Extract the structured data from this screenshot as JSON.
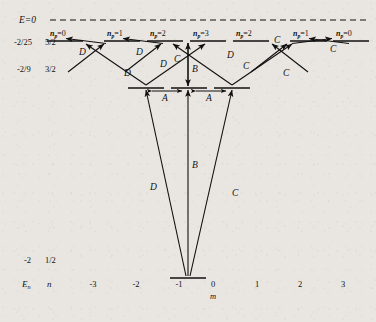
{
  "figure": {
    "type": "energy-level-diagram",
    "background_color": "#e9e6e1",
    "line_color": "#111111",
    "width": 376,
    "height": 322
  },
  "axes": {
    "zero_line_label": "E=0",
    "zero_line_style": "dashed",
    "x_axis_label": "m",
    "x_ticks": [
      "-3",
      "-2",
      "-1",
      "0",
      "1",
      "2",
      "3"
    ],
    "row_headers": [
      "E",
      "n"
    ],
    "row_header_sub": "n"
  },
  "levels": [
    {
      "name": "n-5-2",
      "energy": "-2/25",
      "n": "5/2",
      "m_values": [
        -3,
        -2,
        -1,
        0,
        1,
        2,
        3
      ],
      "np_labels": [
        "n=0",
        "n=1",
        "n=2",
        "n=3",
        "n=2",
        "n=1",
        "n=0"
      ],
      "np_sub": "p",
      "np_values": [
        "0",
        "1",
        "2",
        "3",
        "2",
        "1",
        "0"
      ]
    },
    {
      "name": "n-3-2",
      "energy": "-2/9",
      "n": "3/2",
      "m_values": [
        -1,
        0,
        1
      ],
      "np_values": []
    },
    {
      "name": "n-1-2",
      "energy": "-2",
      "n": "1/2",
      "m_values": [
        0
      ],
      "np_values": []
    }
  ],
  "transition_labels": {
    "A": "A",
    "B": "B",
    "C": "C",
    "D": "D"
  },
  "annotations": [
    {
      "id": "D1",
      "label": "D",
      "x": 79,
      "y": 51
    },
    {
      "id": "D2",
      "label": "D",
      "x": 133,
      "y": 51
    },
    {
      "id": "D3",
      "label": "D",
      "x": 159,
      "y": 63
    },
    {
      "id": "D4",
      "label": "D",
      "x": 126,
      "y": 73
    },
    {
      "id": "C1",
      "label": "C",
      "x": 187,
      "y": 61
    },
    {
      "id": "D5",
      "label": "D",
      "x": 226,
      "y": 54
    },
    {
      "id": "C2",
      "label": "C",
      "x": 245,
      "y": 65
    },
    {
      "id": "C3",
      "label": "C",
      "x": 286,
      "y": 72
    },
    {
      "id": "C4",
      "label": "C",
      "x": 277,
      "y": 41
    },
    {
      "id": "C5",
      "label": "C",
      "x": 333,
      "y": 49
    },
    {
      "id": "B1",
      "label": "B",
      "x": 196,
      "y": 70
    },
    {
      "id": "A1",
      "label": "A",
      "x": 160,
      "y": 96
    },
    {
      "id": "A2",
      "label": "A",
      "x": 214,
      "y": 96
    },
    {
      "id": "B2",
      "label": "B",
      "x": 196,
      "y": 165
    },
    {
      "id": "D6",
      "label": "D",
      "x": 152,
      "y": 185
    },
    {
      "id": "C6",
      "label": "C",
      "x": 235,
      "y": 190
    }
  ],
  "geometry": {
    "note": "m=0 at x=188, spacing 43px; rows y: dashed=20, 5/2=41, 3/2=88, 1/2=278",
    "x_center": 188,
    "x_spacing": 43,
    "y_dashed": 20,
    "y_top": 41,
    "y_mid": 88,
    "y_bottom": 278,
    "seg_half": 18
  }
}
